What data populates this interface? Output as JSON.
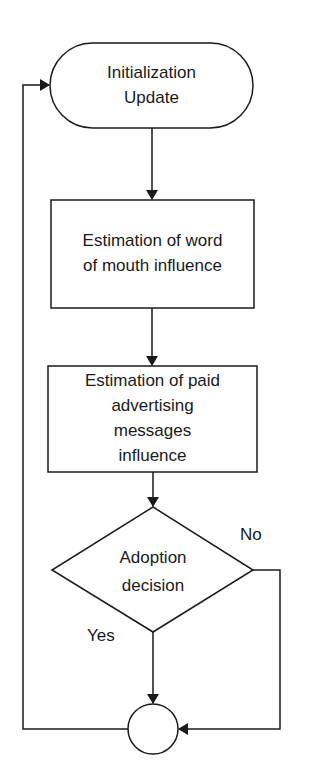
{
  "diagram": {
    "type": "flowchart",
    "nodes": [
      {
        "id": "init",
        "shape": "terminal",
        "text": "Initialization\nUpdate",
        "lines": [
          "Initialization",
          "Update"
        ]
      },
      {
        "id": "wom",
        "shape": "process",
        "text": "Estimation of word of mouth influence",
        "lines": [
          "Estimation of word",
          "of mouth influence"
        ]
      },
      {
        "id": "ads",
        "shape": "process",
        "text": "Estimation of paid advertising messages influence",
        "lines": [
          "Estimation of paid",
          "advertising",
          "messages",
          "influence"
        ]
      },
      {
        "id": "decision",
        "shape": "decision",
        "text": "Adoption decision",
        "lines": [
          "Adoption",
          "decision"
        ]
      },
      {
        "id": "join",
        "shape": "connector",
        "text": ""
      }
    ],
    "edges": [
      {
        "from": "init",
        "to": "wom",
        "label": ""
      },
      {
        "from": "wom",
        "to": "ads",
        "label": ""
      },
      {
        "from": "ads",
        "to": "decision",
        "label": ""
      },
      {
        "from": "decision",
        "to": "join",
        "label": "Yes"
      },
      {
        "from": "decision",
        "to": "join",
        "label": "No"
      },
      {
        "from": "join",
        "to": "init",
        "label": ""
      }
    ],
    "edge_labels": {
      "yes": "Yes",
      "no": "No"
    },
    "colors": {
      "stroke": "#1a1a1a",
      "fill": "#ffffff"
    }
  }
}
